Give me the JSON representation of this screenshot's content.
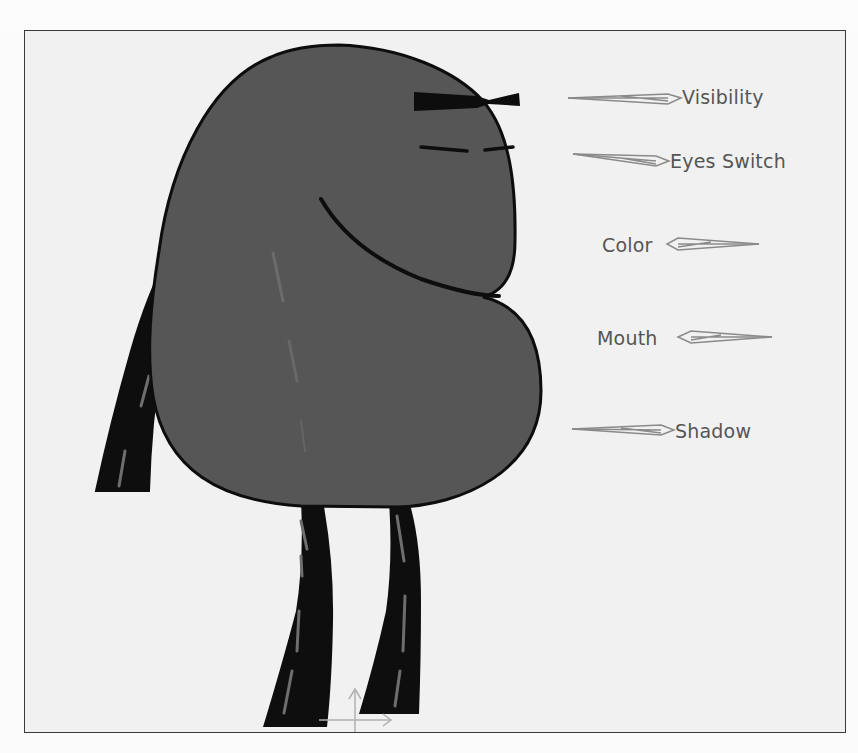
{
  "figure": {
    "colors": {
      "background": "#f1f1f1",
      "frame_border": "#3a3a3a",
      "body_fill": "#565656",
      "outline": "#0d0d0d",
      "limb_fill": "#0e0e0e",
      "limb_highlight": "#6e6e6e",
      "arrow_stroke": "#8a8a8a",
      "label_text": "#555555"
    },
    "controls": [
      {
        "id": "visibility",
        "label": "Visibility",
        "arrow_direction": "right"
      },
      {
        "id": "eyes_switch",
        "label": "Eyes Switch",
        "arrow_direction": "right"
      },
      {
        "id": "color",
        "label": "Color",
        "arrow_direction": "left"
      },
      {
        "id": "mouth",
        "label": "Mouth",
        "arrow_direction": "left"
      },
      {
        "id": "shadow",
        "label": "Shadow",
        "arrow_direction": "right"
      }
    ],
    "move_gizmo": {
      "icon": "move-axes-icon"
    }
  }
}
